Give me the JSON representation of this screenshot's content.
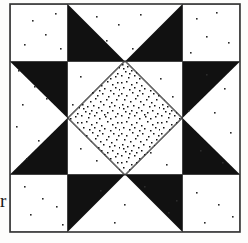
{
  "page": {
    "width": 248,
    "height": 243,
    "background_color": "#fdfdfc",
    "paper_tone": "#f7f6f3"
  },
  "margin_artifact": {
    "name": "stray-letter-r",
    "text": "r",
    "description": "partial letter bleeding in from adjacent column of text"
  },
  "figure": {
    "kind": "quilt-block-diagram",
    "frame": {
      "x": 10,
      "y": 4,
      "width": 230,
      "height": 228,
      "stroke_color": "#333333",
      "stroke_width": 1.6
    },
    "grid": {
      "units_across": 4,
      "units_down": 4,
      "unit_size": 57.5,
      "origin_x": 10,
      "origin_y": 4
    },
    "colors": {
      "dark": "#111111",
      "light": "#ffffff",
      "stipple_ink": "#111111",
      "outline": "#333333"
    },
    "patch_labels": {
      "corner_square": "corner square",
      "star_point": "star point",
      "inner_triangle": "inner triangle",
      "dark_band": "dark diagonal band",
      "center_diamond": "stippled center diamond"
    },
    "center_diamond": {
      "fill": "stipple",
      "center_x": 125,
      "center_y": 118,
      "half_width": 57.5,
      "half_height": 57.5
    },
    "speckle": {
      "count": 54,
      "color": "#2b2b2b",
      "description": "scanned paper noise specks"
    }
  }
}
